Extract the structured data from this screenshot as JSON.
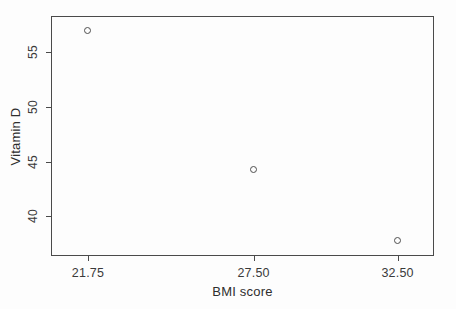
{
  "chart_data": {
    "type": "scatter",
    "title": "",
    "xlabel": "BMI score",
    "ylabel": "Vitamin D",
    "grid": false,
    "legend": null,
    "marker": "open-circle",
    "xlim": [
      20.5,
      33.8
    ],
    "ylim": [
      36.3,
      58.2
    ],
    "xticks": [
      21.75,
      27.5,
      32.5
    ],
    "xtick_labels": [
      "21.75",
      "27.50",
      "32.50"
    ],
    "yticks": [
      40,
      45,
      50,
      55
    ],
    "ytick_labels": [
      "40",
      "45",
      "50",
      "55"
    ],
    "x": [
      21.75,
      27.5,
      32.5
    ],
    "y": [
      57.0,
      44.3,
      37.8
    ],
    "points": [
      {
        "x": 21.75,
        "y": 57.0
      },
      {
        "x": 27.5,
        "y": 44.3
      },
      {
        "x": 32.5,
        "y": 37.8
      }
    ]
  },
  "colors": {
    "background": "#fdfdfd",
    "axis": "#4a4a4a",
    "marker": "#4f4f4f",
    "text": "#2e2e2e"
  }
}
